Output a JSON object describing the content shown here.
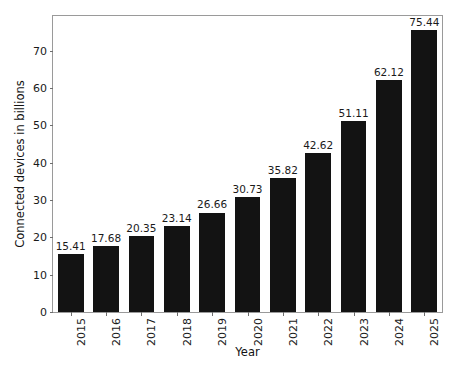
{
  "chart_data": {
    "type": "bar",
    "title": "",
    "subtitle": "",
    "xlabel": "Year",
    "ylabel": "Connected devices in billions",
    "categories": [
      "2015",
      "2016",
      "2017",
      "2018",
      "2019",
      "2020",
      "2021",
      "2022",
      "2023",
      "2024",
      "2025"
    ],
    "values": [
      15.41,
      17.68,
      20.35,
      23.14,
      26.66,
      30.73,
      35.82,
      42.62,
      51.11,
      62.12,
      75.44
    ],
    "value_labels": [
      "15.41",
      "17.68",
      "20.35",
      "23.14",
      "26.66",
      "30.73",
      "35.82",
      "42.62",
      "51.11",
      "62.12",
      "75.44"
    ],
    "ylim": [
      0,
      79.3
    ],
    "ytick_values": [
      0,
      10,
      20,
      30,
      40,
      50,
      60,
      70
    ],
    "ytick_labels": [
      "0",
      "10",
      "20",
      "30",
      "40",
      "50",
      "60",
      "70"
    ],
    "grid": false,
    "legend": false,
    "legend_position": "none",
    "bar_color": "#131313",
    "text_color": "#1a1a1a",
    "frame_color": "#9a9a9a",
    "background_color": "#ffffff",
    "xtick_rotation": -90,
    "bar_width_fraction": 0.73
  }
}
